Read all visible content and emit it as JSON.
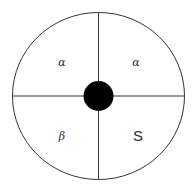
{
  "diagram": {
    "colors": {
      "stroke": "#333333",
      "dot": "#000000",
      "background": "#ffffff"
    },
    "quadrants": [
      {
        "position": "top-left",
        "label": "α"
      },
      {
        "position": "top-right",
        "label": "α"
      },
      {
        "position": "bottom-left",
        "label": "β"
      },
      {
        "position": "bottom-right",
        "label": "S"
      }
    ]
  }
}
